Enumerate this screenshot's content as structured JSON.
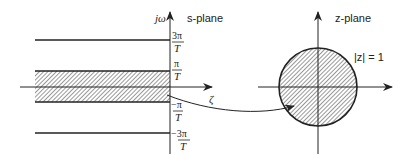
{
  "s_plane": {
    "title": "s-plane",
    "vertical_axis_label": "jω",
    "horizontal_axis_label": "ζ",
    "ticks": [
      {
        "num": "3π",
        "den": "T"
      },
      {
        "num": "π",
        "den": "T"
      },
      {
        "num": "−π",
        "den": "T"
      },
      {
        "num": "−3π",
        "den": "T"
      }
    ],
    "shaded_band": "−π/T to π/T"
  },
  "z_plane": {
    "title": "z-plane",
    "circle_label": "|z| = 1"
  },
  "colors": {
    "line": "#222222",
    "background": "#ffffff"
  }
}
